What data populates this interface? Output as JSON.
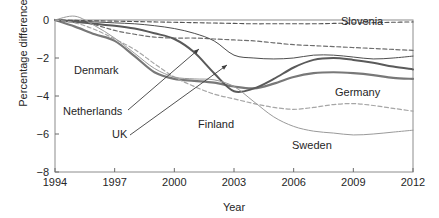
{
  "chart_data": {
    "type": "line",
    "title": "",
    "xlabel": "Year",
    "ylabel": "Percentage difference",
    "xlim": [
      1994,
      2012
    ],
    "ylim": [
      -8,
      0
    ],
    "xticks": [
      1994,
      1997,
      2000,
      2003,
      2006,
      2009,
      2012
    ],
    "yticks": [
      0,
      -2,
      -4,
      -6,
      -8
    ],
    "xtick_labels": [
      "1994",
      "1997",
      "2000",
      "2003",
      "2006",
      "2009",
      "2012"
    ],
    "ytick_labels": [
      "0",
      "−2",
      "−4",
      "−6",
      "−8"
    ],
    "grid": false,
    "legend": "inline-labels",
    "x": [
      1994,
      1995,
      1996,
      1997,
      1998,
      1999,
      2000,
      2001,
      2002,
      2003,
      2004,
      2005,
      2006,
      2007,
      2008,
      2009,
      2010,
      2011,
      2012
    ],
    "series": [
      {
        "name": "Slovenia",
        "style": "dashed",
        "color": "#555555",
        "width": 1.1,
        "values": [
          0.0,
          -0.02,
          -0.04,
          -0.06,
          -0.08,
          -0.1,
          -0.12,
          -0.14,
          -0.16,
          -0.18,
          -0.2,
          -0.2,
          -0.2,
          -0.2,
          -0.18,
          -0.16,
          -0.14,
          -0.12,
          -0.1
        ]
      },
      {
        "name": "Netherlands",
        "style": "dashed",
        "color": "#6e6e6e",
        "width": 1.2,
        "values": [
          0.0,
          -0.05,
          -0.25,
          -0.55,
          -0.75,
          -0.9,
          -0.95,
          -0.95,
          -1.0,
          -1.05,
          -1.1,
          -1.2,
          -1.3,
          -1.35,
          -1.4,
          -1.45,
          -1.5,
          -1.55,
          -1.6
        ]
      },
      {
        "name": "Denmark",
        "style": "solid",
        "color": "#4d4d4d",
        "width": 1.0,
        "values": [
          0.0,
          -0.05,
          -0.1,
          -0.15,
          -0.2,
          -0.3,
          -0.45,
          -0.7,
          -1.1,
          -1.85,
          -2.0,
          -2.05,
          -2.0,
          -1.85,
          -1.85,
          -1.95,
          -2.05,
          -2.0,
          -1.9
        ]
      },
      {
        "name": "Germany",
        "style": "solid",
        "color": "#787878",
        "width": 2.2,
        "values": [
          0.0,
          -0.35,
          -0.75,
          -1.1,
          -1.9,
          -2.75,
          -3.1,
          -3.2,
          -3.3,
          -3.5,
          -3.6,
          -3.35,
          -3.0,
          -2.8,
          -2.75,
          -2.8,
          -2.9,
          -3.05,
          -3.1
        ]
      },
      {
        "name": "UK",
        "style": "solid",
        "color": "#5a5a5a",
        "width": 2.0,
        "values": [
          0.0,
          -0.1,
          -0.2,
          -0.3,
          -0.45,
          -0.7,
          -1.0,
          -1.7,
          -2.8,
          -3.75,
          -3.6,
          -3.1,
          -2.5,
          -2.1,
          -2.0,
          -2.1,
          -2.25,
          -2.45,
          -2.6
        ]
      },
      {
        "name": "Finland",
        "style": "dashed",
        "color": "#a6a6a6",
        "width": 1.2,
        "values": [
          0.0,
          -0.15,
          -0.5,
          -1.0,
          -1.55,
          -2.3,
          -3.0,
          -3.5,
          -3.9,
          -4.15,
          -4.4,
          -4.6,
          -4.7,
          -4.6,
          -4.45,
          -4.4,
          -4.5,
          -4.65,
          -4.8
        ]
      },
      {
        "name": "Sweden",
        "style": "solid",
        "color": "#9a9a9a",
        "width": 1.0,
        "values": [
          0.0,
          0.2,
          -0.3,
          -0.95,
          -1.75,
          -2.55,
          -3.0,
          -3.1,
          -3.15,
          -3.5,
          -4.3,
          -5.1,
          -5.6,
          -5.85,
          -5.95,
          -6.05,
          -6.0,
          -5.9,
          -5.8
        ]
      }
    ],
    "annotations": [
      {
        "label": "Slovenia",
        "x_px": 341,
        "y_px": 25,
        "anchor": "start"
      },
      {
        "label": "Denmark",
        "x_px": 74,
        "y_px": 74,
        "anchor": "start"
      },
      {
        "label": "Netherlands",
        "x_px": 63,
        "y_px": 115,
        "anchor": "start"
      },
      {
        "label": "UK",
        "x_px": 112,
        "y_px": 138,
        "anchor": "start"
      },
      {
        "label": "Finland",
        "x_px": 198,
        "y_px": 128,
        "anchor": "start"
      },
      {
        "label": "Germany",
        "x_px": 335,
        "y_px": 96,
        "anchor": "start"
      },
      {
        "label": "Sweden",
        "x_px": 292,
        "y_px": 149,
        "anchor": "start"
      }
    ],
    "leaders": [
      {
        "from": "Netherlands",
        "x1_px": 128,
        "y1_px": 110,
        "x2_px": 199,
        "y2_px": 49
      },
      {
        "from": "UK",
        "x1_px": 130,
        "y1_px": 135,
        "x2_px": 227,
        "y2_px": 65
      }
    ]
  }
}
